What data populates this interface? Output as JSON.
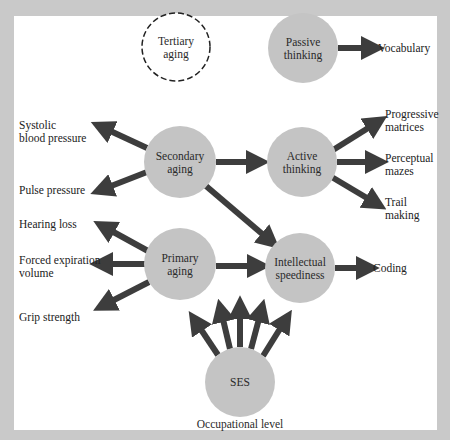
{
  "colors": {
    "background": "#c9c9c9",
    "panel": "#ffffff",
    "node_fill": "#c4c4c4",
    "arrow": "#3d3d3d",
    "text": "#222222"
  },
  "nodes": {
    "tertiary_aging": {
      "line1": "Tertiary",
      "line2": "aging",
      "style": "dashed"
    },
    "passive_thinking": {
      "line1": "Passive",
      "line2": "thinking"
    },
    "secondary_aging": {
      "line1": "Secondary",
      "line2": "aging"
    },
    "active_thinking": {
      "line1": "Active",
      "line2": "thinking"
    },
    "primary_aging": {
      "line1": "Primary",
      "line2": "aging"
    },
    "intellectual_speediness": {
      "line1": "Intellectual",
      "line2": "speediness"
    },
    "ses": {
      "line1": "SES"
    }
  },
  "outcomes": {
    "vocabulary": "Vocabulary",
    "progressive_matrices": {
      "line1": "Progressive",
      "line2": "matrices"
    },
    "perceptual_mazes": {
      "line1": "Perceptual",
      "line2": "mazes"
    },
    "trail_making": {
      "line1": "Trail",
      "line2": "making"
    },
    "coding": "Coding",
    "systolic_bp": {
      "line1": "Systolic",
      "line2": "blood pressure"
    },
    "pulse_pressure": "Pulse pressure",
    "hearing_loss": "Hearing loss",
    "forced_expiration": {
      "line1": "Forced expiration",
      "line2": "volume"
    },
    "grip_strength": "Grip strength",
    "occupational_level": "Occupational level"
  },
  "edges": [
    {
      "from": "Passive thinking",
      "to": "Vocabulary"
    },
    {
      "from": "Secondary aging",
      "to": "Systolic blood pressure"
    },
    {
      "from": "Secondary aging",
      "to": "Pulse pressure"
    },
    {
      "from": "Secondary aging",
      "to": "Active thinking"
    },
    {
      "from": "Secondary aging",
      "to": "Intellectual speediness"
    },
    {
      "from": "Active thinking",
      "to": "Progressive matrices"
    },
    {
      "from": "Active thinking",
      "to": "Perceptual mazes"
    },
    {
      "from": "Active thinking",
      "to": "Trail making"
    },
    {
      "from": "Primary aging",
      "to": "Hearing loss"
    },
    {
      "from": "Primary aging",
      "to": "Forced expiration volume"
    },
    {
      "from": "Primary aging",
      "to": "Grip strength"
    },
    {
      "from": "Primary aging",
      "to": "Intellectual speediness"
    },
    {
      "from": "Intellectual speediness",
      "to": "Coding"
    },
    {
      "from": "SES",
      "to": "upward (5 arrows)"
    }
  ]
}
